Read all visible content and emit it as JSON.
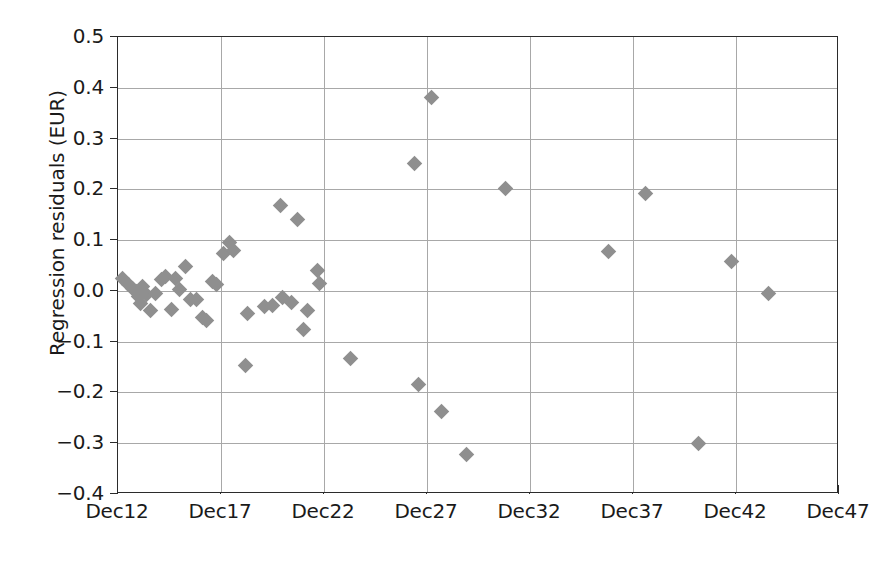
{
  "chart_data": {
    "type": "scatter",
    "title": "",
    "xlabel": "",
    "ylabel": "Regression residuals (EUR)",
    "grid": true,
    "legend": null,
    "marker": {
      "shape": "diamond",
      "color": "#8f8f8f",
      "size_px": 11
    },
    "xaxis": {
      "tick_labels": [
        "Dec12",
        "Dec17",
        "Dec22",
        "Dec27",
        "Dec32",
        "Dec37",
        "Dec42",
        "Dec47"
      ],
      "tick_values": [
        12,
        17,
        22,
        27,
        32,
        37,
        42,
        47
      ],
      "xlim": [
        12,
        47
      ]
    },
    "yaxis": {
      "tick_labels": [
        "0.5",
        "0.4",
        "0.3",
        "0.2",
        "0.1",
        "0.0",
        "−0.1",
        "−0.2",
        "−0.3",
        "−0.4"
      ],
      "tick_values": [
        0.5,
        0.4,
        0.3,
        0.2,
        0.1,
        0.0,
        -0.1,
        -0.2,
        -0.3,
        -0.4
      ],
      "ylim": [
        -0.4,
        0.5
      ]
    },
    "points": [
      {
        "x": 12.2,
        "y": 0.025
      },
      {
        "x": 12.5,
        "y": 0.012
      },
      {
        "x": 12.7,
        "y": 0.005
      },
      {
        "x": 12.9,
        "y": -0.002
      },
      {
        "x": 13.0,
        "y": -0.012
      },
      {
        "x": 13.1,
        "y": -0.025
      },
      {
        "x": 13.2,
        "y": 0.008
      },
      {
        "x": 13.4,
        "y": -0.008
      },
      {
        "x": 13.6,
        "y": -0.038
      },
      {
        "x": 13.8,
        "y": -0.005
      },
      {
        "x": 14.1,
        "y": 0.022
      },
      {
        "x": 14.3,
        "y": 0.028
      },
      {
        "x": 14.6,
        "y": -0.037
      },
      {
        "x": 14.8,
        "y": 0.025
      },
      {
        "x": 15.0,
        "y": 0.002
      },
      {
        "x": 15.3,
        "y": 0.048
      },
      {
        "x": 15.5,
        "y": -0.016
      },
      {
        "x": 15.8,
        "y": -0.017
      },
      {
        "x": 16.1,
        "y": -0.052
      },
      {
        "x": 16.3,
        "y": -0.058
      },
      {
        "x": 16.6,
        "y": 0.018
      },
      {
        "x": 16.8,
        "y": 0.012
      },
      {
        "x": 17.1,
        "y": 0.073
      },
      {
        "x": 17.4,
        "y": 0.095
      },
      {
        "x": 17.6,
        "y": 0.079
      },
      {
        "x": 18.2,
        "y": -0.146
      },
      {
        "x": 18.3,
        "y": -0.045
      },
      {
        "x": 19.1,
        "y": -0.03
      },
      {
        "x": 19.5,
        "y": -0.029
      },
      {
        "x": 19.9,
        "y": 0.168
      },
      {
        "x": 20.0,
        "y": -0.013
      },
      {
        "x": 20.4,
        "y": -0.023
      },
      {
        "x": 20.7,
        "y": 0.14
      },
      {
        "x": 21.0,
        "y": -0.076
      },
      {
        "x": 21.2,
        "y": -0.038
      },
      {
        "x": 21.7,
        "y": 0.041
      },
      {
        "x": 21.8,
        "y": 0.015
      },
      {
        "x": 23.3,
        "y": -0.134
      },
      {
        "x": 26.4,
        "y": 0.25
      },
      {
        "x": 26.6,
        "y": -0.184
      },
      {
        "x": 27.2,
        "y": 0.38
      },
      {
        "x": 27.7,
        "y": -0.238
      },
      {
        "x": 28.9,
        "y": -0.323
      },
      {
        "x": 30.8,
        "y": 0.201
      },
      {
        "x": 35.8,
        "y": 0.078
      },
      {
        "x": 37.6,
        "y": 0.192
      },
      {
        "x": 40.2,
        "y": -0.301
      },
      {
        "x": 41.8,
        "y": 0.058
      },
      {
        "x": 43.6,
        "y": -0.006
      }
    ]
  }
}
